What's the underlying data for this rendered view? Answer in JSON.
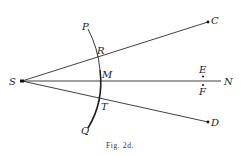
{
  "figure": {
    "caption": "Fig. 2d.",
    "points": {
      "S": "S",
      "C": "C",
      "D": "D",
      "N": "N",
      "E": "E",
      "F": "F",
      "P": "P",
      "Q": "Q",
      "R": "R",
      "M": "M",
      "T": "T"
    },
    "lines": [
      {
        "from": "S",
        "to": "C"
      },
      {
        "from": "S",
        "to": "N"
      },
      {
        "from": "S",
        "to": "D"
      }
    ],
    "arc": {
      "from": "P",
      "through": [
        "R",
        "M",
        "T"
      ],
      "to": "Q"
    },
    "dots": [
      "S",
      "C",
      "D",
      "E",
      "F"
    ]
  }
}
